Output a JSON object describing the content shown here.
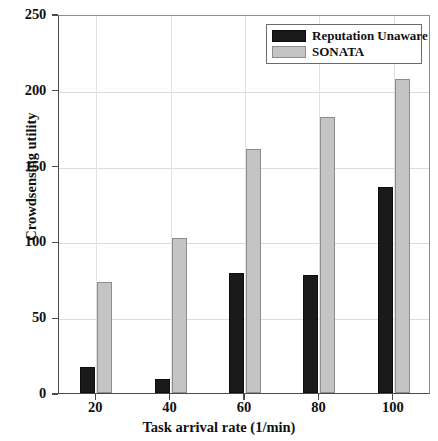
{
  "chart_data": {
    "type": "bar",
    "title": "",
    "xlabel": "Task arrival rate (1/min)",
    "ylabel": "Crowdsensing utility",
    "categories": [
      "20",
      "40",
      "60",
      "80",
      "100"
    ],
    "series": [
      {
        "name": "Reputation Unaware",
        "color": "#1a1a1a",
        "values": [
          17,
          9,
          79,
          78,
          136
        ]
      },
      {
        "name": "SONATA",
        "color": "#c4c4c4",
        "values": [
          73,
          102,
          161,
          182,
          207
        ]
      }
    ],
    "ylim": [
      0,
      250
    ],
    "yticks": [
      "0",
      "50",
      "100",
      "150",
      "200",
      "250"
    ],
    "ytick_values": [
      0,
      50,
      100,
      150,
      200,
      250
    ],
    "xticks": [
      "20",
      "40",
      "60",
      "80",
      "100"
    ],
    "grid": true,
    "legend_position": "top-right"
  }
}
